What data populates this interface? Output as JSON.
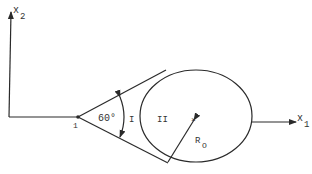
{
  "diagram": {
    "axes": {
      "vertical_label": "x",
      "vertical_subscript": "2",
      "horizontal_label": "x",
      "horizontal_subscript": "1"
    },
    "vertex_label": "1",
    "angle_label": "60°",
    "region_labels": {
      "cone": "I",
      "circle": "II"
    },
    "radius_label": "R",
    "radius_subscript": "O",
    "colors": {
      "line": "#2a2a2a",
      "background": "#ffffff"
    }
  }
}
